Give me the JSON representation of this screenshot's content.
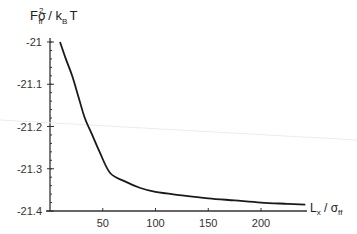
{
  "chart_data": {
    "type": "line",
    "title": "",
    "ylabel": "Fσ_ff^2 / k_B T",
    "xlabel": "L_x / σ_ff",
    "ylim": [
      -21.4,
      -21.0
    ],
    "xlim": [
      0,
      245
    ],
    "grid": false,
    "legend": null,
    "x_ticks": [
      50,
      100,
      150,
      200
    ],
    "y_ticks": [
      -21,
      -21.1,
      -21.2,
      -21.3,
      -21.4
    ],
    "y_tick_labels": [
      "-21",
      "-21.1",
      "-21.2",
      "-21.3",
      "-21.4"
    ],
    "x_tick_labels": [
      "50",
      "100",
      "150",
      "200"
    ],
    "series": [
      {
        "name": "F",
        "x": [
          9.5,
          15,
          21,
          27,
          33,
          40,
          47,
          57,
          71,
          85,
          100,
          125,
          150,
          175,
          200,
          225,
          242
        ],
        "y": [
          -21.0,
          -21.04,
          -21.08,
          -21.13,
          -21.18,
          -21.22,
          -21.26,
          -21.31,
          -21.33,
          -21.345,
          -21.355,
          -21.363,
          -21.37,
          -21.375,
          -21.38,
          -21.383,
          -21.385
        ]
      }
    ]
  },
  "labels": {
    "y_main": "Fσ",
    "y_sup": "2",
    "y_sub": "ff",
    "y_rest": " / k",
    "y_sub2": "B",
    "y_end": "T",
    "x_main": "L",
    "x_sub": "x",
    "x_mid": " / σ",
    "x_sub2": "ff"
  }
}
